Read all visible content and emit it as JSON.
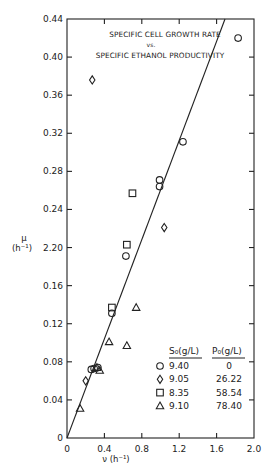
{
  "chart_data": {
    "type": "scatter",
    "title": "SPECIFIC CELL GROWTH RATE",
    "title_vs": "vs.",
    "subtitle": "SPECIFIC ETHANOL PRODUCTIVITY",
    "xlabel": "ν (h⁻¹)",
    "ylabel_symbol": "μ",
    "ylabel_unit": "(h⁻¹)",
    "xlim": [
      0,
      2.0
    ],
    "ylim": [
      0,
      0.44
    ],
    "x_ticks": [
      0,
      0.4,
      0.8,
      1.2,
      1.6,
      2.0
    ],
    "x_tick_labels": [
      "0",
      "0.4",
      "0.8",
      "1.2",
      "1.6",
      "2.0"
    ],
    "y_ticks": [
      0,
      0.04,
      0.08,
      0.12,
      0.16,
      0.2,
      0.24,
      0.28,
      0.32,
      0.36,
      0.4,
      0.44
    ],
    "y_tick_labels": [
      "0",
      "0.04",
      "0.08",
      "0.12",
      "0.16",
      "2.20",
      "0.24",
      "0.28",
      "0.32",
      "0.36",
      "0.40",
      "0.44"
    ],
    "grid": false,
    "fit_line": {
      "x": [
        0,
        1.69
      ],
      "y": [
        0,
        0.44
      ],
      "slope": 0.26
    },
    "legend": {
      "position": "lower right",
      "header_s0": "S₀(g/L)",
      "header_p0": "P₀(g/L)",
      "entries": [
        {
          "marker": "circle",
          "symbol": "○",
          "s0": "9.40",
          "p0": "0"
        },
        {
          "marker": "diamond",
          "symbol": "◇",
          "s0": "9.05",
          "p0": "26.22"
        },
        {
          "marker": "square",
          "symbol": "□",
          "s0": "8.35",
          "p0": "58.54"
        },
        {
          "marker": "triangle",
          "symbol": "△",
          "s0": "9.10",
          "p0": "78.40"
        }
      ]
    },
    "series": [
      {
        "name": "S0=9.40, P0=0",
        "marker": "circle",
        "points": [
          [
            1.83,
            0.42
          ],
          [
            1.24,
            0.311
          ],
          [
            0.99,
            0.271
          ],
          [
            0.99,
            0.264
          ],
          [
            0.63,
            0.191
          ],
          [
            0.48,
            0.131
          ],
          [
            0.26,
            0.072
          ],
          [
            0.29,
            0.073
          ],
          [
            0.33,
            0.074
          ]
        ]
      },
      {
        "name": "S0=9.05, P0=26.22",
        "marker": "diamond",
        "points": [
          [
            0.27,
            0.376
          ],
          [
            1.04,
            0.221
          ],
          [
            0.2,
            0.06
          ]
        ]
      },
      {
        "name": "S0=8.35, P0=58.54",
        "marker": "square",
        "points": [
          [
            0.7,
            0.257
          ],
          [
            0.64,
            0.203
          ],
          [
            0.48,
            0.137
          ]
        ]
      },
      {
        "name": "S0=9.10, P0=78.40",
        "marker": "triangle",
        "points": [
          [
            0.74,
            0.137
          ],
          [
            0.45,
            0.101
          ],
          [
            0.64,
            0.097
          ],
          [
            0.32,
            0.074
          ],
          [
            0.35,
            0.071
          ],
          [
            0.14,
            0.031
          ]
        ]
      }
    ]
  }
}
